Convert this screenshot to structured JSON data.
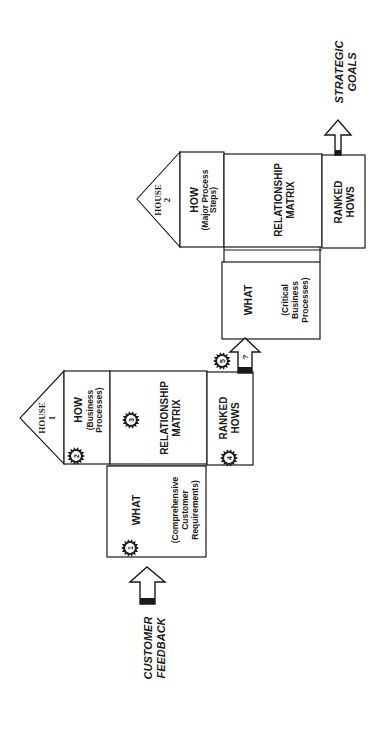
{
  "diagram": {
    "orientation": "rotated-90-ccw",
    "house1": {
      "roof_label": "HOUSE",
      "roof_number": "1",
      "how_title": "HOW",
      "how_sub1": "(Business",
      "how_sub2": "Processes)",
      "matrix_line1": "RELATIONSHIP",
      "matrix_line2": "MATRIX",
      "ranked_line1": "RANKED",
      "ranked_line2": "HOWS",
      "what_title": "WHAT",
      "what_sub1": "(Comprehensive",
      "what_sub2": "Customer",
      "what_sub3": "Requirements)"
    },
    "house2": {
      "roof_label": "HOUSE",
      "roof_number": "2",
      "how_title": "HOW",
      "how_sub1": "(Major Process",
      "how_sub2": "Steps)",
      "matrix_line1": "RELATIONSHIP",
      "matrix_line2": "MATRIX",
      "ranked_line1": "RANKED",
      "ranked_line2": "HOWS",
      "what_title": "WHAT",
      "what_sub1": "(Critical",
      "what_sub2": "Business",
      "what_sub3": "Processes)"
    },
    "badges": [
      "1",
      "2",
      "3",
      "4",
      "5"
    ],
    "arrow_mid_label": "?",
    "input_label_line1": "CUSTOMER",
    "input_label_line2": "FEEDBACK",
    "output_label_line1": "STRATEGIC",
    "output_label_line2": "GOALS"
  }
}
